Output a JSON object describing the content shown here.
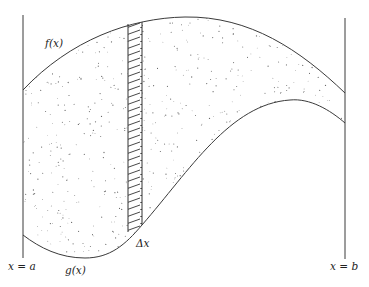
{
  "diagram": {
    "labels": {
      "f": "f(x)",
      "g": "g(x)",
      "dx": "Δx",
      "left_bound": "x = a",
      "right_bound": "x = b"
    },
    "colors": {
      "stroke": "#3a3a3a",
      "dots": "#6a6a6a",
      "hatch": "#333333",
      "background": "#ffffff"
    },
    "elements": {
      "upper_curve": "f(x)",
      "lower_curve": "g(x)",
      "region": "stippled area between f(x) and g(x) on [a, b]",
      "strip": "hatched vertical rectangle of width Δx"
    }
  }
}
